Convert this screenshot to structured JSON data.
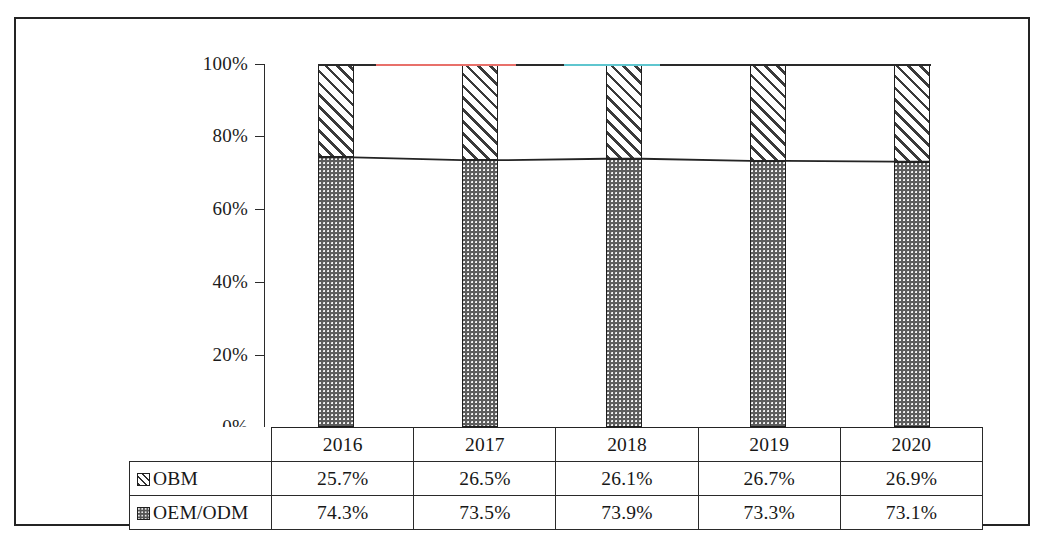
{
  "chart_data": {
    "type": "bar",
    "subtype": "100% stacked column with data table",
    "title": "",
    "subtitle": "",
    "xlabel": "",
    "ylabel": "",
    "categories": [
      "2016",
      "2017",
      "2018",
      "2019",
      "2020"
    ],
    "series": [
      {
        "name": "OBM",
        "marker": "white-diagonal-hatch-square",
        "values": [
          25.7,
          26.5,
          26.1,
          26.7,
          26.9
        ],
        "labels": [
          "25.7%",
          "26.5%",
          "26.1%",
          "26.7%",
          "26.9%"
        ]
      },
      {
        "name": "OEM/ODM",
        "marker": "dark-grey-dotted-square",
        "values": [
          74.3,
          73.5,
          73.9,
          73.3,
          73.1
        ],
        "labels": [
          "74.3%",
          "73.5%",
          "73.9%",
          "73.3%",
          "73.1%"
        ]
      }
    ],
    "stack_order": [
      "OEM/ODM",
      "OBM"
    ],
    "ylim": [
      0,
      100
    ],
    "ytick_values": [
      0,
      20,
      40,
      60,
      80,
      100
    ],
    "ytick_labels": [
      "0%",
      "20%",
      "40%",
      "60%",
      "80%",
      "100%"
    ],
    "grid": false,
    "legend_position": "data-table-row-headers",
    "annotations": [
      {
        "name": "top-connector-line",
        "description": "horizontal line joining the 100% tops of all columns",
        "value": 100
      },
      {
        "name": "segment-boundary-connector-line",
        "description": "line joining the tops of the OEM/ODM segments",
        "values": [
          74.3,
          73.5,
          73.9,
          73.3,
          73.1
        ]
      }
    ]
  },
  "axis": {
    "y_labels": [
      "100%",
      "80%",
      "60%",
      "40%",
      "20%",
      "0%"
    ]
  },
  "table": {
    "header_row": [
      "",
      "2016",
      "2017",
      "2018",
      "2019",
      "2020"
    ],
    "rows": [
      {
        "label": "OBM",
        "swatch": "obm-hatch-swatch",
        "cells": [
          "25.7%",
          "26.5%",
          "26.1%",
          "26.7%",
          "26.9%"
        ]
      },
      {
        "label": "OEM/ODM",
        "swatch": "oem-dot-swatch",
        "cells": [
          "74.3%",
          "73.5%",
          "73.9%",
          "73.3%",
          "73.1%"
        ]
      }
    ]
  },
  "caption": {
    "sliver_text": "————————  ————  ——————  ——  ———  —————"
  },
  "colors": {
    "frame": "#242424",
    "axis": "#2b2b2b",
    "oem_fill": "#5d5d5d",
    "obm_fill": "#ffffff",
    "hatch": "#3a3a3a",
    "line_100_red_artifact": "#e8706a",
    "line_100_cyan_artifact": "#5fc6cf",
    "line_100_black": "#2a2a2a"
  }
}
